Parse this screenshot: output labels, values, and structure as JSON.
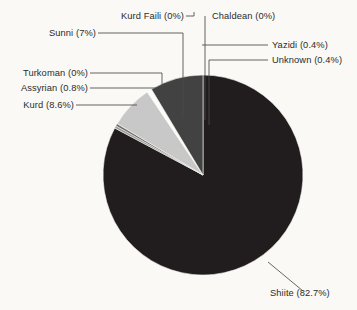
{
  "chart_data": {
    "type": "pie",
    "title": "",
    "subtitle": "",
    "xlabel": "",
    "ylabel": "",
    "legend_position": "callout-labels",
    "grid": false,
    "units": "percent",
    "start_angle_deg": 0,
    "direction": "clockwise",
    "categories": [
      "Shiite",
      "Yazidi",
      "Unknown",
      "Chaldean",
      "Kurd Faili",
      "Sunni",
      "Assyrian",
      "Turkoman",
      "Kurd"
    ],
    "values": [
      82.7,
      0.4,
      0.4,
      0,
      0,
      7,
      0.8,
      0,
      8.6
    ],
    "labels": [
      "Shiite (82.7%)",
      "Yazidi (0.4%)",
      "Unknown (0.4%)",
      "Chaldean (0%)",
      "Kurd Faili (0%)",
      "Sunni (7%)",
      "Assyrian (0.8%)",
      "Turkoman (0%)",
      "Kurd (8.6%)"
    ],
    "colors": [
      "#211d1e",
      "#9a9a9a",
      "#6e6e6e",
      "#b5b5b5",
      "#8a8a8a",
      "#c8c8c8",
      "#fbfbf7",
      "#7d7d7d",
      "#424242"
    ],
    "slices": [
      {
        "name": "Shiite",
        "value": 82.7,
        "label": "Shiite (82.7%)",
        "color": "#211d1e"
      },
      {
        "name": "Yazidi",
        "value": 0.4,
        "label": "Yazidi (0.4%)",
        "color": "#9a9a9a"
      },
      {
        "name": "Unknown",
        "value": 0.4,
        "label": "Unknown (0.4%)",
        "color": "#6e6e6e"
      },
      {
        "name": "Chaldean",
        "value": 0,
        "label": "Chaldean (0%)",
        "color": "#b5b5b5"
      },
      {
        "name": "Kurd Faili",
        "value": 0,
        "label": "Kurd Faili (0%)",
        "color": "#8a8a8a"
      },
      {
        "name": "Sunni",
        "value": 7,
        "label": "Sunni (7%)",
        "color": "#c8c8c8"
      },
      {
        "name": "Assyrian",
        "value": 0.8,
        "label": "Assyrian (0.8%)",
        "color": "#fbfbf7"
      },
      {
        "name": "Turkoman",
        "value": 0,
        "label": "Turkoman (0%)",
        "color": "#7d7d7d"
      },
      {
        "name": "Kurd",
        "value": 8.6,
        "label": "Kurd (8.6%)",
        "color": "#424242"
      }
    ],
    "background_color": "#faf9f5",
    "leader_line_color": "#4a4a4a",
    "label_text_color": "#2b2b2b"
  },
  "callouts": {
    "kurd_faili": "Kurd Faili (0%)",
    "chaldean": "Chaldean (0%)",
    "sunni": "Sunni (7%)",
    "yazidi": "Yazidi (0.4%)",
    "unknown": "Unknown (0.4%)",
    "turkoman": "Turkoman (0%)",
    "assyrian": "Assyrian (0.8%)",
    "kurd": "Kurd (8.6%)",
    "shiite": "Shiite (82.7%)"
  }
}
